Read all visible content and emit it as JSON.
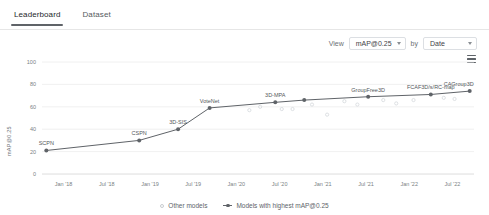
{
  "tabs": [
    {
      "label": "Leaderboard",
      "active": true
    },
    {
      "label": "Dataset",
      "active": false
    }
  ],
  "controls": {
    "view_label": "View",
    "metric_value": "mAP@0.25",
    "by_label": "by",
    "sort_value": "Date",
    "menu_icon": "hamburger-menu-icon"
  },
  "chart_data": {
    "type": "line",
    "title": "",
    "xlabel": "",
    "ylabel": "mAP@0.25",
    "ylim": [
      0,
      100
    ],
    "yticks": [
      0,
      20,
      40,
      60,
      80,
      100
    ],
    "xticks": [
      "Jan '18",
      "Jul '18",
      "Jan '19",
      "Jul '19",
      "Jan '20",
      "Jul '20",
      "Jan '21",
      "Jul '21",
      "Jan '22",
      "Jul '22"
    ],
    "grid": true,
    "legend_position": "bottom",
    "legend": [
      {
        "name": "Other models",
        "marker": "open-circle",
        "color": "#c8ccd0"
      },
      {
        "name": "Models with highest mAP@0.25",
        "marker": "filled-circle-line",
        "color": "#5f6368"
      }
    ],
    "series": [
      {
        "name": "Models with highest mAP@0.25",
        "color": "#5f6368",
        "points": [
          {
            "label": "SCPN",
            "x": "2018-01",
            "xf": 0.01,
            "y": 21
          },
          {
            "label": "CSPN",
            "x": "2018-12",
            "xf": 0.225,
            "y": 30
          },
          {
            "label": "3D-SIS",
            "x": "2019-04",
            "xf": 0.315,
            "y": 40
          },
          {
            "label": "VoteNet",
            "x": "2019-07",
            "xf": 0.388,
            "y": 59
          },
          {
            "label": "3D-MPA",
            "x": "2020-03",
            "xf": 0.54,
            "y": 64
          },
          {
            "label": "",
            "x": "2020-06",
            "xf": 0.607,
            "y": 66
          },
          {
            "label": "GroupFree3D",
            "x": "2021-02",
            "xf": 0.755,
            "y": 69
          },
          {
            "label": "FCAF3D/s/RC-map",
            "x": "2022-01",
            "xf": 0.9,
            "y": 71
          },
          {
            "label": "CAGroup3D",
            "x": "2022-08",
            "xf": 0.99,
            "y": 74
          }
        ]
      },
      {
        "name": "Other models",
        "color": "#d4d8dc",
        "points": [
          {
            "xf": 0.48,
            "y": 57
          },
          {
            "xf": 0.505,
            "y": 60
          },
          {
            "xf": 0.555,
            "y": 58
          },
          {
            "xf": 0.58,
            "y": 58
          },
          {
            "xf": 0.625,
            "y": 62
          },
          {
            "xf": 0.66,
            "y": 53
          },
          {
            "xf": 0.7,
            "y": 65
          },
          {
            "xf": 0.73,
            "y": 62
          },
          {
            "xf": 0.79,
            "y": 66
          },
          {
            "xf": 0.82,
            "y": 63
          },
          {
            "xf": 0.86,
            "y": 66
          },
          {
            "xf": 0.93,
            "y": 68
          },
          {
            "xf": 0.955,
            "y": 67
          }
        ]
      }
    ]
  }
}
